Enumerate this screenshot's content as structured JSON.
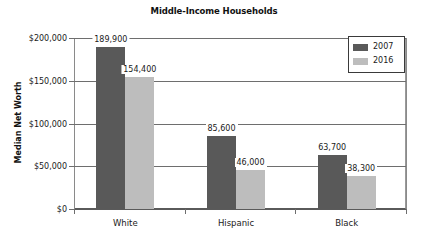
{
  "chart_data": {
    "type": "bar",
    "title": "Middle-Income Households",
    "xlabel": "",
    "ylabel": "Median Net Worth",
    "categories": [
      "White",
      "Hispanic",
      "Black"
    ],
    "series": [
      {
        "name": "2007",
        "color": "#595959",
        "values": [
          189900,
          154400,
          63700
        ]
      },
      {
        "name": "2016",
        "color": "#bdbdbd",
        "values": [
          154400,
          46000,
          38300
        ]
      }
    ],
    "ylim": [
      0,
      200000
    ],
    "yticks": [
      0,
      50000,
      100000,
      150000,
      200000
    ],
    "ytick_labels": [
      "$0",
      "$50,000",
      "$100,000",
      "$150,000",
      "$200,000"
    ],
    "grid": true,
    "legend_position": "top-right",
    "data_labels": [
      [
        "189,900",
        "154,400"
      ],
      [
        "85,600",
        "46,000"
      ],
      [
        "63,700",
        "38,300"
      ]
    ]
  },
  "chart": {
    "title": "Middle-Income Households",
    "y_axis_title": "Median Net Worth",
    "y_ticks": [
      {
        "label": "$200,000",
        "value": 200000
      },
      {
        "label": "$150,000",
        "value": 150000
      },
      {
        "label": "$100,000",
        "value": 100000
      },
      {
        "label": "$50,000",
        "value": 50000
      },
      {
        "label": "$0",
        "value": 0
      }
    ],
    "categories": [
      {
        "name": "White",
        "bars": [
          {
            "series": "2007",
            "value": 189900,
            "label": "189,900"
          },
          {
            "series": "2016",
            "value": 154400,
            "label": "154,400"
          }
        ]
      },
      {
        "name": "Hispanic",
        "bars": [
          {
            "series": "2007",
            "value": 85600,
            "label": "85,600"
          },
          {
            "series": "2016",
            "value": 46000,
            "label": "46,000"
          }
        ]
      },
      {
        "name": "Black",
        "bars": [
          {
            "series": "2007",
            "value": 63700,
            "label": "63,700"
          },
          {
            "series": "2016",
            "value": 38300,
            "label": "38,300"
          }
        ]
      }
    ],
    "legend": [
      {
        "label": "2007",
        "color": "#595959"
      },
      {
        "label": "2016",
        "color": "#bdbdbd"
      }
    ]
  }
}
